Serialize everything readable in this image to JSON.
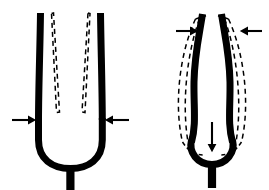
{
  "figure": {
    "background_color": "#ffffff",
    "ink_color": "#000000",
    "width": 269,
    "height": 190,
    "panel_count": 2,
    "stroke_widths": {
      "fork_solid": 7,
      "ghost_dashed": 1.5,
      "arrow_shaft": 2.1
    },
    "dash_pattern": "5 4"
  },
  "panels": [
    {
      "id": "panel-left",
      "name": "fundamental-mode-panel",
      "label": "",
      "mode_name": "tines squeezed inward",
      "fork": {
        "orientation": "upright",
        "tine_count": 2,
        "solid_outline_meaning": "undeflected / splayed rest position of the tines",
        "dashed_outline_meaning": "deflected position of the tines pressed toward each other",
        "base_shape": "deep U-shaped bend",
        "stem": "short thick vertical handle below the U"
      },
      "arrows": [
        {
          "name": "force-arrow-left",
          "direction": "right",
          "points_toward": "left tine, mid-height",
          "position": "outside left tine",
          "orientation": "horizontal"
        },
        {
          "name": "force-arrow-right",
          "direction": "left",
          "points_toward": "right tine, mid-height",
          "position": "outside right tine",
          "orientation": "horizontal"
        }
      ]
    },
    {
      "id": "panel-right",
      "name": "clang-mode-panel",
      "label": "",
      "mode_name": "tines pinched near tips with base recoil",
      "fork": {
        "orientation": "upright",
        "tine_count": 2,
        "solid_outline_meaning": "S-curved deflected shape of the tines",
        "dashed_outline_meaning": "outward bowed envelope of the vibrating tines",
        "base_shape": "rounded U-shaped bend",
        "stem": "short thick vertical handle below the U"
      },
      "arrows": [
        {
          "name": "force-arrow-top-left",
          "direction": "right",
          "points_toward": "left tine, near the tip",
          "position": "outside left tine near top",
          "orientation": "horizontal"
        },
        {
          "name": "force-arrow-top-right",
          "direction": "left",
          "points_toward": "right tine, near the tip",
          "position": "outside right tine near top",
          "orientation": "horizontal"
        },
        {
          "name": "force-arrow-base-down",
          "direction": "down",
          "points_toward": "inner base of the U bend",
          "position": "inside the U, above the base",
          "orientation": "vertical"
        }
      ]
    }
  ]
}
